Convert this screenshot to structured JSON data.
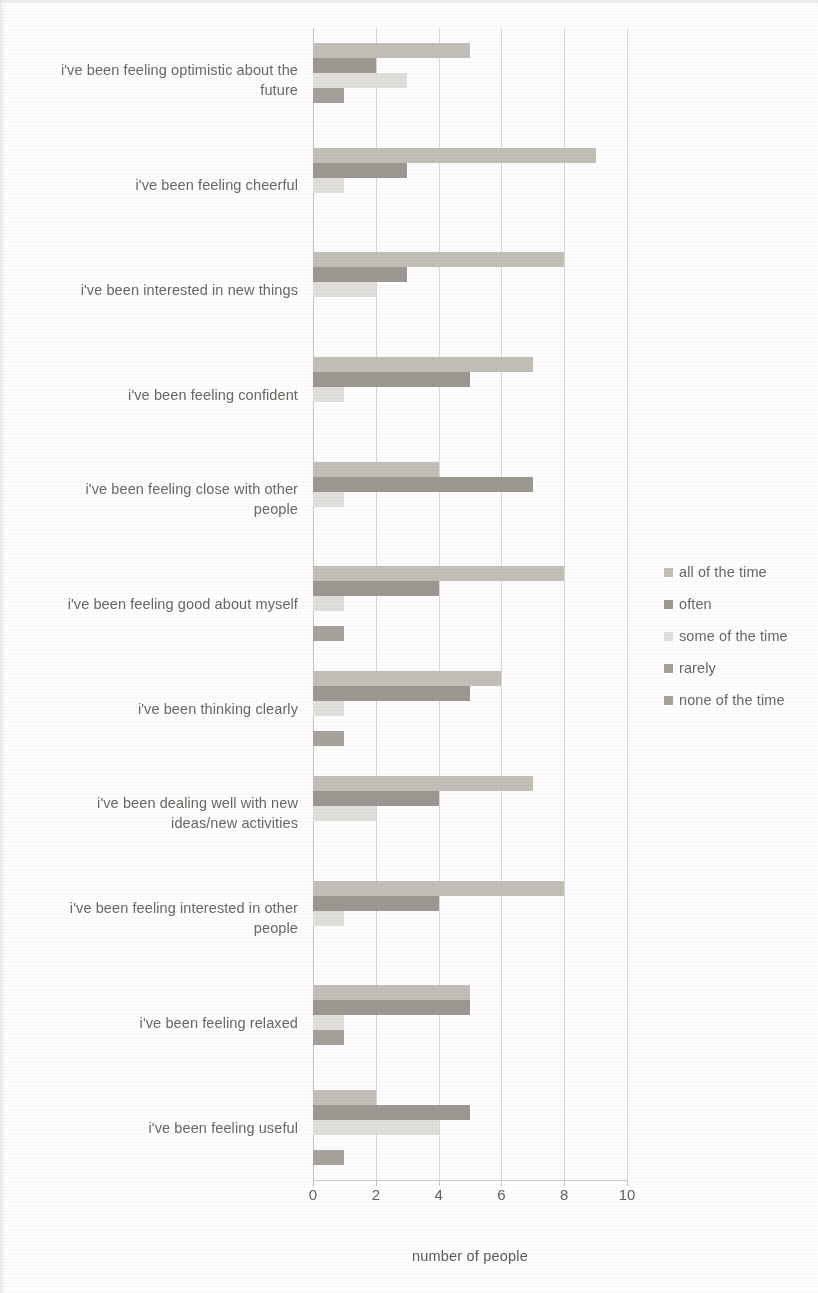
{
  "chart_data": {
    "type": "bar",
    "orientation": "horizontal",
    "title": "",
    "xlabel": "number of people",
    "ylabel": "",
    "xlim": [
      0,
      10
    ],
    "xticks": [
      0,
      2,
      4,
      6,
      8,
      10
    ],
    "grid": true,
    "legend_position": "right",
    "categories": [
      "i've been feeling optimistic about the future",
      "i've been feeling cheerful",
      "i've been interested in new things",
      "i've been feeling confident",
      "i've been feeling close with other people",
      "i've been feeling good about myself",
      "i've been thinking clearly",
      "i've been dealing well with new ideas/new activities",
      "i've been feeling interested in other people",
      "i've been feeling relaxed",
      "i've been feeling useful"
    ],
    "series": [
      {
        "name": "all of the time",
        "color": "#c3c0ba",
        "values": [
          5,
          9,
          8,
          7,
          4,
          8,
          6,
          7,
          8,
          5,
          2
        ]
      },
      {
        "name": "often",
        "color": "#9d9992",
        "values": [
          2,
          3,
          3,
          5,
          7,
          4,
          5,
          4,
          4,
          5,
          5
        ]
      },
      {
        "name": "some of the time",
        "color": "#e2e0dc",
        "values": [
          3,
          1,
          2,
          1,
          1,
          1,
          1,
          2,
          1,
          1,
          4
        ]
      },
      {
        "name": "rarely",
        "color": "#a5a19a",
        "values": [
          1,
          0,
          0,
          0,
          0,
          0,
          0,
          0,
          0,
          1,
          0
        ]
      },
      {
        "name": "none of the time",
        "color": "#a8a49d",
        "values": [
          0,
          0,
          0,
          0,
          0,
          1,
          1,
          0,
          0,
          0,
          1
        ]
      }
    ]
  },
  "axis": {
    "x_title": "number of people",
    "tick_labels": [
      "0",
      "2",
      "4",
      "6",
      "8",
      "10"
    ]
  },
  "legend": {
    "items": [
      {
        "label": "all of the time"
      },
      {
        "label": "often"
      },
      {
        "label": "some of the time"
      },
      {
        "label": "rarely"
      },
      {
        "label": "none of the time"
      }
    ]
  },
  "category_labels": [
    {
      "lines": [
        "i've been feeling optimistic about the",
        "future"
      ]
    },
    {
      "lines": [
        "i've been feeling cheerful"
      ]
    },
    {
      "lines": [
        "i've been interested in new things"
      ]
    },
    {
      "lines": [
        "i've been feeling confident"
      ]
    },
    {
      "lines": [
        "i've been feeling close with other",
        "people"
      ]
    },
    {
      "lines": [
        "i've been feeling good about myself"
      ]
    },
    {
      "lines": [
        "i've been thinking clearly"
      ]
    },
    {
      "lines": [
        "i've been dealing well with new",
        "ideas/new activities"
      ]
    },
    {
      "lines": [
        "i've been feeling interested in other",
        "people"
      ]
    },
    {
      "lines": [
        "i've been feeling relaxed"
      ]
    },
    {
      "lines": [
        "i've been feeling useful"
      ]
    }
  ]
}
